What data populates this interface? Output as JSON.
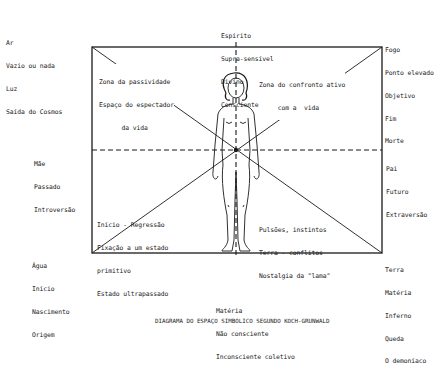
{
  "diagram": {
    "caption": "DIAGRAMA DO ESPAÇO SIMBÓLICO SEGUNDO KOCH-GRUNWALD",
    "corners": {
      "top_left": [
        "Ar",
        "Vazio ou nada",
        "Luz",
        "Saída do Cosmos"
      ],
      "top_right": [
        "Fogo",
        "Ponto elevado",
        "Objetivo",
        "Fim",
        "Morte"
      ],
      "bottom_left": [
        "Água",
        "Início",
        "Nascimento",
        "Origem"
      ],
      "bottom_right": [
        "Terra",
        "Matéria",
        "Inferno",
        "Queda",
        "O demoníaco"
      ]
    },
    "axes": {
      "top": [
        "Espírito",
        "Supra-sensível",
        "Divino",
        "Consciente"
      ],
      "bottom": [
        "Matéria",
        "Não consciente",
        "Inconsciente coletivo"
      ],
      "left": [
        "Mãe",
        "Passado",
        "Introversão"
      ],
      "right": [
        "Pai",
        "Futuro",
        "Extraversão"
      ]
    },
    "zones": {
      "upper_left": [
        "Zona da passividade",
        "Espaço do espectador",
        "      da vida"
      ],
      "upper_right": [
        "Zona do confronto ativo",
        "     com a  vida"
      ],
      "lower_left": [
        "Início - Regressão",
        "Fixação a um estado",
        "primitivo",
        "Estado ultrapassado"
      ],
      "lower_right": [
        "Pulsões, instintos",
        "Terra - conflitos",
        "Nostalgia da \"lama\""
      ]
    },
    "figure": "standing-human-figure",
    "colors": {
      "ink": "#1a1a1a",
      "background": "#ffffff"
    }
  }
}
